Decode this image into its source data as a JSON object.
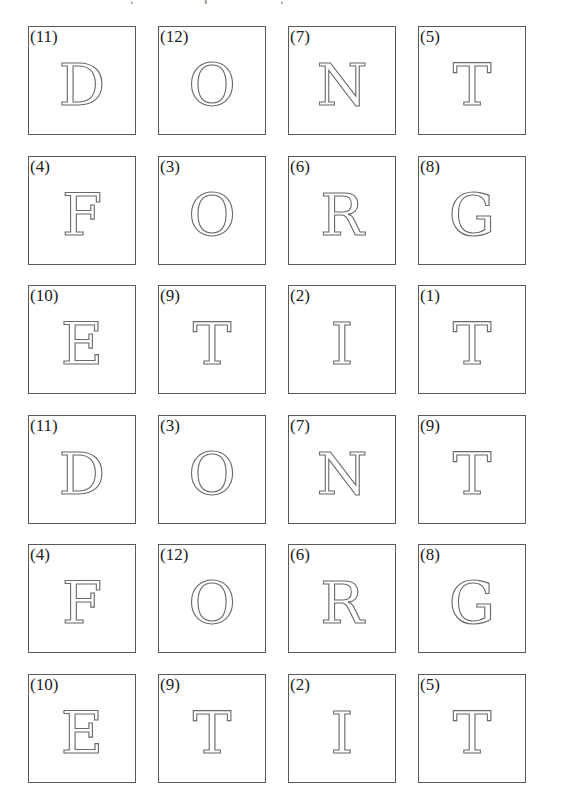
{
  "header": {
    "clipped_text_marks": [
      "˛",
      "ʒ",
      "˛"
    ]
  },
  "grid": {
    "columns": 4,
    "rows": [
      [
        {
          "number": "(11)",
          "letter": "D"
        },
        {
          "number": "(12)",
          "letter": "O"
        },
        {
          "number": "(7)",
          "letter": "N"
        },
        {
          "number": "(5)",
          "letter": "T"
        }
      ],
      [
        {
          "number": "(4)",
          "letter": "F"
        },
        {
          "number": "(3)",
          "letter": "O"
        },
        {
          "number": "(6)",
          "letter": "R"
        },
        {
          "number": "(8)",
          "letter": "G"
        }
      ],
      [
        {
          "number": "(10)",
          "letter": "E"
        },
        {
          "number": "(9)",
          "letter": "T"
        },
        {
          "number": "(2)",
          "letter": "I"
        },
        {
          "number": "(1)",
          "letter": "T"
        }
      ],
      [
        {
          "number": "(11)",
          "letter": "D"
        },
        {
          "number": "(3)",
          "letter": "O"
        },
        {
          "number": "(7)",
          "letter": "N"
        },
        {
          "number": "(9)",
          "letter": "T"
        }
      ],
      [
        {
          "number": "(4)",
          "letter": "F"
        },
        {
          "number": "(12)",
          "letter": "O"
        },
        {
          "number": "(6)",
          "letter": "R"
        },
        {
          "number": "(8)",
          "letter": "G"
        }
      ],
      [
        {
          "number": "(10)",
          "letter": "E"
        },
        {
          "number": "(9)",
          "letter": "T"
        },
        {
          "number": "(2)",
          "letter": "I"
        },
        {
          "number": "(5)",
          "letter": "T"
        }
      ]
    ]
  },
  "colors": {
    "background": "#ffffff",
    "tile_border": "#5a5a5a",
    "letter_outline": "#6a6a6a",
    "label_text": "#222222"
  }
}
